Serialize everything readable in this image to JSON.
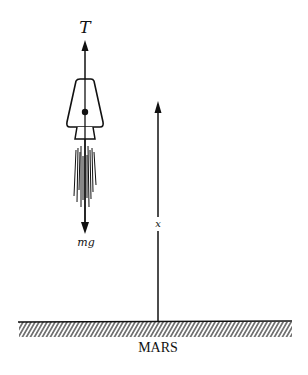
{
  "figure": {
    "type": "free-body diagram",
    "labels": {
      "thrust": "T",
      "weight": "mg",
      "height": "x",
      "ground": "MARS"
    },
    "colors": {
      "ink": "#111111",
      "background": "#ffffff"
    },
    "arrows": [
      {
        "name": "thrust",
        "direction": "up",
        "label": "T"
      },
      {
        "name": "weight",
        "direction": "down",
        "label": "mg"
      },
      {
        "name": "height",
        "direction": "up",
        "label": "x"
      }
    ]
  }
}
